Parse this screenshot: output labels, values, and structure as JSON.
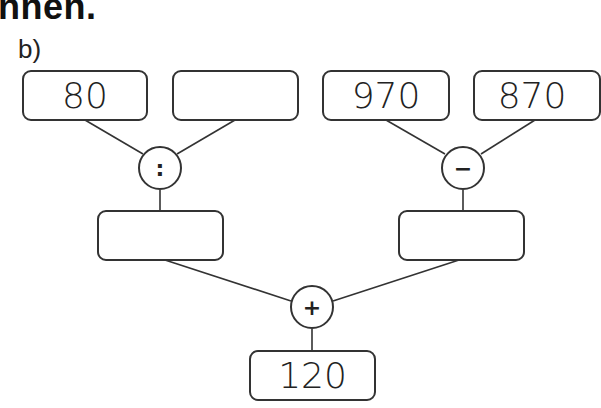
{
  "heading": "nnen.",
  "task_label": "b)",
  "diagram": {
    "top_boxes": [
      {
        "value": "80"
      },
      {
        "value": ""
      },
      {
        "value": "970"
      },
      {
        "value": "870"
      }
    ],
    "operators": {
      "left": ":",
      "right": "−",
      "bottom": "+"
    },
    "middle_boxes": [
      {
        "value": ""
      },
      {
        "value": ""
      }
    ],
    "result_box": {
      "value": "120"
    }
  }
}
